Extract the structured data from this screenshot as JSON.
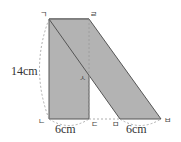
{
  "diagram": {
    "labels": {
      "giyeok": "ㄱ",
      "rieul": "ㄹ",
      "nieun": "ㄴ",
      "digeut": "ㄷ",
      "mieum": "ㅁ",
      "bieup": "ㅂ",
      "siot": "ㅅ"
    },
    "measurements": {
      "height": "14cm",
      "rect_base": "6cm",
      "parallelogram_base": "6cm"
    },
    "colors": {
      "fill": "#b3b3b3",
      "stroke": "#555555",
      "dashed": "#999999"
    }
  }
}
